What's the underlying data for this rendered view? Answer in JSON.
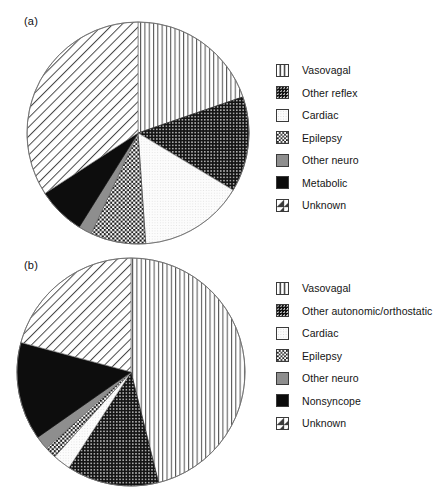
{
  "figure": {
    "background": "#ffffff",
    "width": 444,
    "height": 491
  },
  "panels": [
    {
      "id": "a",
      "label": "(a)",
      "center": {
        "x": 138,
        "y": 133
      },
      "radius": 112
    },
    {
      "id": "b",
      "label": "(b)",
      "center": {
        "x": 131,
        "y": 373
      },
      "radius": 114
    }
  ],
  "legend_a": {
    "items": [
      {
        "label": "Vasovagal",
        "pattern": "vertical-lines",
        "swatch_class": "sw-vertical",
        "color": "#4a4a4a"
      },
      {
        "label": "Other reflex",
        "pattern": "dense-dots-on-black",
        "swatch_class": "sw-dense-dots-dark",
        "color": "#111111"
      },
      {
        "label": "Cardiac",
        "pattern": "very-light-stipple",
        "swatch_class": "sw-light",
        "color": "#f2f2f2"
      },
      {
        "label": "Epilepsy",
        "pattern": "checkerboard",
        "swatch_class": "sw-checker",
        "color": "#1b1b1b"
      },
      {
        "label": "Other neuro",
        "pattern": "solid-gray",
        "swatch_class": "sw-solid-gray",
        "color": "#8e8e8e"
      },
      {
        "label": "Metabolic",
        "pattern": "solid-black",
        "swatch_class": "sw-solid-black",
        "color": "#0b0b0b"
      },
      {
        "label": "Unknown",
        "pattern": "diagonal-lines",
        "swatch_class": "sw-diagonal",
        "color": "#3c3c3c"
      }
    ]
  },
  "legend_b": {
    "items": [
      {
        "label": "Vasovagal",
        "pattern": "vertical-lines",
        "swatch_class": "sw-vertical",
        "color": "#4a4a4a"
      },
      {
        "label": "Other autonomic/orthostatic",
        "pattern": "dense-dots-on-black",
        "swatch_class": "sw-dense-dots-dark",
        "color": "#111111"
      },
      {
        "label": "Cardiac",
        "pattern": "very-light-stipple",
        "swatch_class": "sw-light",
        "color": "#f2f2f2"
      },
      {
        "label": "Epilepsy",
        "pattern": "checkerboard",
        "swatch_class": "sw-checker",
        "color": "#1b1b1b"
      },
      {
        "label": "Other neuro",
        "pattern": "solid-gray",
        "swatch_class": "sw-solid-gray",
        "color": "#8e8e8e"
      },
      {
        "label": "Nonsyncope",
        "pattern": "solid-black",
        "swatch_class": "sw-solid-black",
        "color": "#0b0b0b"
      },
      {
        "label": "Unknown",
        "pattern": "diagonal-lines",
        "swatch_class": "sw-diagonal",
        "color": "#3c3c3c"
      }
    ]
  },
  "chart_data": [
    {
      "type": "pie",
      "title": "(a)",
      "panel": "a",
      "start_angle_deg": 0,
      "direction": "clockwise",
      "categories": [
        "Vasovagal",
        "Other reflex",
        "Cardiac",
        "Epilepsy",
        "Other neuro",
        "Metabolic",
        "Unknown"
      ],
      "values_percent": [
        19.7,
        13.9,
        15.3,
        8.0,
        1.9,
        6.9,
        34.3
      ],
      "slice_angles_deg": [
        71,
        50,
        55,
        29,
        7,
        25,
        123
      ],
      "slice_boundaries_deg": [
        0,
        71,
        121,
        176,
        205,
        212,
        237,
        360
      ],
      "patterns": [
        "vertical-lines",
        "dense-dots-on-black",
        "very-light-stipple",
        "checkerboard",
        "solid-gray",
        "solid-black",
        "diagonal-lines"
      ],
      "legend_position": "right",
      "grid": false,
      "xlabel": "",
      "ylabel": ""
    },
    {
      "type": "pie",
      "title": "(b)",
      "panel": "b",
      "start_angle_deg": 0,
      "direction": "clockwise",
      "categories": [
        "Vasovagal",
        "Other autonomic/orthostatic",
        "Cardiac",
        "Epilepsy",
        "Other neuro",
        "Nonsyncope",
        "Unknown"
      ],
      "values_percent": [
        46.1,
        13.1,
        2.5,
        1.7,
        1.9,
        13.9,
        20.8
      ],
      "slice_angles_deg": [
        166,
        47,
        9,
        6,
        7,
        50,
        75
      ],
      "slice_boundaries_deg": [
        0,
        166,
        213,
        222,
        228,
        235,
        285,
        360
      ],
      "patterns": [
        "vertical-lines",
        "dense-dots-on-black",
        "very-light-stipple",
        "checkerboard",
        "solid-gray",
        "solid-black",
        "diagonal-lines"
      ],
      "legend_position": "right",
      "grid": false,
      "xlabel": "",
      "ylabel": ""
    }
  ]
}
